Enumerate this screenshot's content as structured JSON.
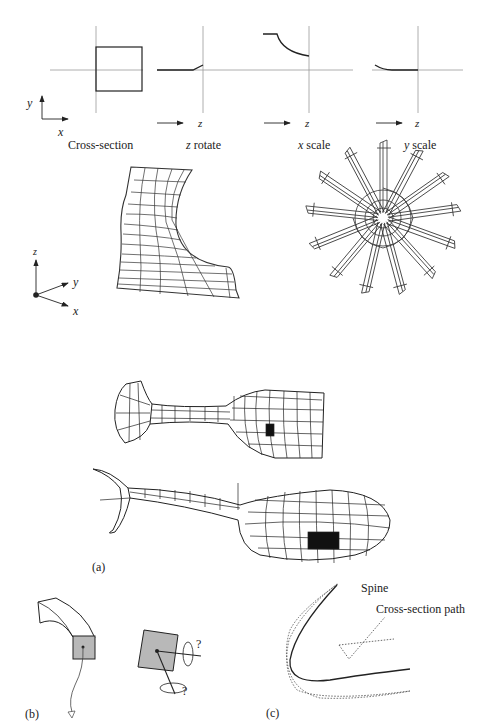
{
  "panel_a": {
    "graphs": [
      {
        "id": "cross-section",
        "caption": "Cross-section",
        "axis_x": "x",
        "axis_y": "y"
      },
      {
        "id": "z-rotate",
        "caption_var": "z",
        "caption_rest": " rotate",
        "axis": "z"
      },
      {
        "id": "x-scale",
        "caption_var": "x",
        "caption_rest": " scale",
        "axis": "z"
      },
      {
        "id": "y-scale",
        "caption_var": "y",
        "caption_rest": " scale",
        "axis": "z"
      }
    ],
    "axes3d": {
      "x": "x",
      "y": "y",
      "z": "z"
    },
    "label": "(a)"
  },
  "panel_b": {
    "label": "(b)",
    "question_marks": [
      "?",
      "?"
    ]
  },
  "panel_c": {
    "label": "(c)",
    "spine_label": "Spine",
    "path_label": "Cross-section path"
  },
  "colors": {
    "ink": "#222222",
    "fill_gray": "#b8b8b8",
    "axis_gray": "#888888"
  }
}
